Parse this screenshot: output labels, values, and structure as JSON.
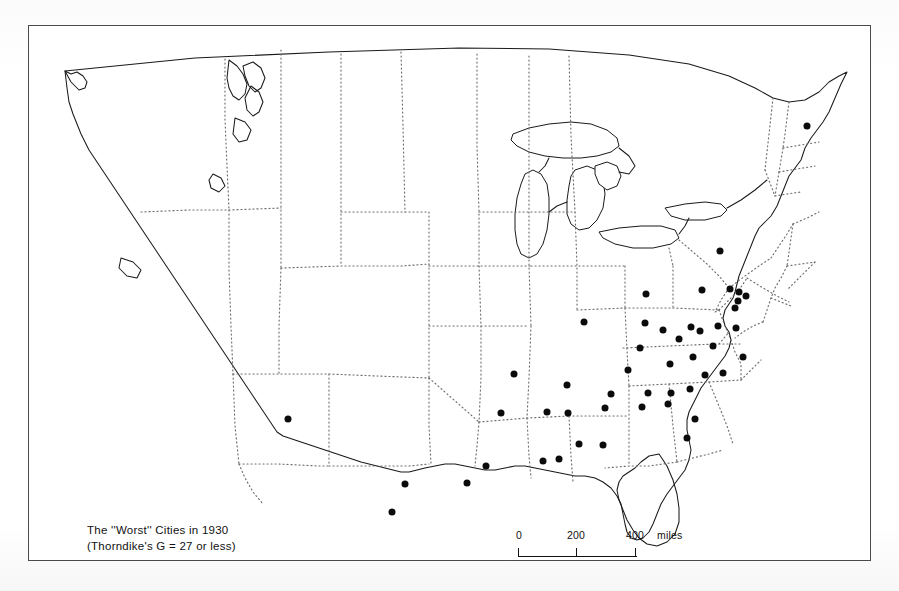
{
  "figure": {
    "kind": "thematic-dot-map",
    "region": "United States",
    "frame_color": "#4a4a4a",
    "caption_lines": [
      "The ''Worst'' Cities in 1930",
      "(Thorndike's G = 27 or less)"
    ]
  },
  "scale": {
    "unit_label": "miles",
    "tick_labels": [
      "0",
      "200",
      "400"
    ],
    "tick_values": [
      0,
      200,
      400
    ]
  },
  "chart_data": {
    "type": "scatter",
    "title": "The ''Worst'' Cities in 1930 (Thorndike's G = 27 or less)",
    "xlabel": "",
    "ylabel": "",
    "projection": "United States, conic",
    "grid": false,
    "legend": null,
    "marker": {
      "shape": "circle",
      "color": "#0b0b0b",
      "diameter_px": 7
    },
    "annotations": [
      "The ''Worst'' Cities in 1930",
      "(Thorndike's G = 27 or less)",
      "0",
      "200",
      "400 miles"
    ],
    "series": [
      {
        "name": "Cities with Thorndike's G of 27 or less",
        "count": 48,
        "points": [
          {
            "x": 806,
            "y": 125
          },
          {
            "x": 719,
            "y": 250
          },
          {
            "x": 729,
            "y": 288
          },
          {
            "x": 738,
            "y": 291
          },
          {
            "x": 745,
            "y": 295
          },
          {
            "x": 737,
            "y": 300
          },
          {
            "x": 734,
            "y": 307
          },
          {
            "x": 701,
            "y": 289
          },
          {
            "x": 645,
            "y": 293
          },
          {
            "x": 583,
            "y": 321
          },
          {
            "x": 644,
            "y": 322
          },
          {
            "x": 690,
            "y": 326
          },
          {
            "x": 699,
            "y": 330
          },
          {
            "x": 717,
            "y": 325
          },
          {
            "x": 735,
            "y": 327
          },
          {
            "x": 712,
            "y": 345
          },
          {
            "x": 678,
            "y": 338
          },
          {
            "x": 662,
            "y": 329
          },
          {
            "x": 639,
            "y": 347
          },
          {
            "x": 627,
            "y": 369
          },
          {
            "x": 669,
            "y": 363
          },
          {
            "x": 692,
            "y": 356
          },
          {
            "x": 704,
            "y": 374
          },
          {
            "x": 722,
            "y": 372
          },
          {
            "x": 742,
            "y": 356
          },
          {
            "x": 689,
            "y": 388
          },
          {
            "x": 670,
            "y": 392
          },
          {
            "x": 647,
            "y": 392
          },
          {
            "x": 610,
            "y": 393
          },
          {
            "x": 566,
            "y": 384
          },
          {
            "x": 513,
            "y": 373
          },
          {
            "x": 546,
            "y": 411
          },
          {
            "x": 567,
            "y": 412
          },
          {
            "x": 604,
            "y": 407
          },
          {
            "x": 641,
            "y": 406
          },
          {
            "x": 667,
            "y": 403
          },
          {
            "x": 500,
            "y": 412
          },
          {
            "x": 578,
            "y": 443
          },
          {
            "x": 602,
            "y": 444
          },
          {
            "x": 686,
            "y": 437
          },
          {
            "x": 694,
            "y": 418
          },
          {
            "x": 558,
            "y": 458
          },
          {
            "x": 542,
            "y": 460
          },
          {
            "x": 485,
            "y": 465
          },
          {
            "x": 466,
            "y": 482
          },
          {
            "x": 404,
            "y": 483
          },
          {
            "x": 391,
            "y": 511
          },
          {
            "x": 287,
            "y": 418
          }
        ]
      }
    ]
  }
}
